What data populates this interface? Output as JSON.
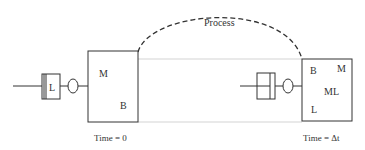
{
  "diagram": {
    "process_label": "Process",
    "left": {
      "box_labels": {
        "m": "M",
        "b": "B"
      },
      "component_label": "L",
      "caption": "Time = 0"
    },
    "right": {
      "box_labels": {
        "b": "B",
        "m": "M",
        "ml": "ML",
        "l": "L"
      },
      "caption": "Time = Δt"
    },
    "colors": {
      "stroke": "#333333",
      "guide": "#bbbbbb"
    }
  }
}
